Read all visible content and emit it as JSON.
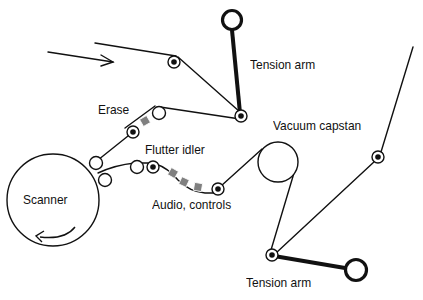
{
  "labels": {
    "tension_arm_top": "Tension arm",
    "erase": "Erase",
    "vacuum_capstan": "Vacuum capstan",
    "flutter_idler": "Flutter idler",
    "scanner": "Scanner",
    "audio_controls": "Audio, controls",
    "tension_arm_bottom": "Tension arm"
  },
  "colors": {
    "line": "#111111",
    "head": "#808080",
    "background": "#ffffff"
  }
}
